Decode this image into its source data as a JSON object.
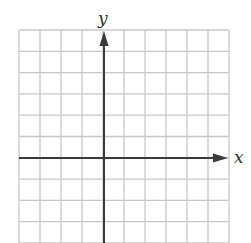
{
  "diagram": {
    "type": "coordinate-plane",
    "x_axis_label": "x",
    "y_axis_label": "y",
    "grid": {
      "columns": 10,
      "rows": 10,
      "origin_column": 4,
      "origin_row": 6,
      "line_color": "#c8c8c8",
      "axis_color": "#3a3a3a"
    }
  }
}
